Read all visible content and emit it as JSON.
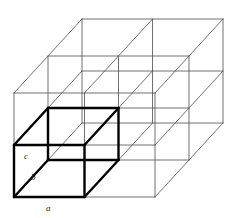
{
  "figure": {
    "background_color": "#ffffff",
    "line_color_thin": "#4d4d4d",
    "line_color_bold": "#000000",
    "line_width_thin": 0.8,
    "line_width_bold": 2.4,
    "repeats": {
      "along_a": 2,
      "along_b": 2,
      "along_c": 2
    }
  },
  "projection": {
    "origin": {
      "x": 14,
      "y": 197
    },
    "vector_a": {
      "dx": 70.5,
      "dy": 0
    },
    "vector_b": {
      "dx": 34.0,
      "dy": -37.0
    },
    "vector_c": {
      "dx": 0,
      "dy": -52.0
    }
  },
  "labels": [
    {
      "id": "label-a",
      "text": "a",
      "x": 46,
      "y": 211,
      "vector": "a"
    },
    {
      "id": "label-b",
      "text": "b",
      "x": 31,
      "y": 180,
      "vector": "b"
    },
    {
      "id": "label-c",
      "text": "c",
      "x": 24,
      "y": 159,
      "vector": "c"
    }
  ],
  "highlighted_cell": {
    "name": "unit-cell",
    "index": {
      "a": 0,
      "b": 0,
      "c": 0
    },
    "stroke": "#000000"
  }
}
